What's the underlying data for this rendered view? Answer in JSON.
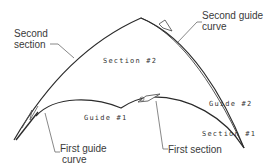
{
  "diagram": {
    "type": "loft-sections-guides",
    "colors": {
      "curve": "#2b2b2b",
      "leader": "#6a6a6a",
      "text": "#3a3a3a",
      "background": "#ffffff"
    },
    "callouts": {
      "second_section": {
        "line1": "Second",
        "line2": "section"
      },
      "second_guide_curve": {
        "line1": "Second guide",
        "line2": "curve"
      },
      "first_guide_curve": {
        "line1": "First guide",
        "line2": "curve"
      },
      "first_section": {
        "line1": "First section"
      }
    },
    "labels": {
      "section2": "Section #2",
      "guide1": "Guide #1",
      "guide2": "Guide #2",
      "section1": "Section #1"
    }
  }
}
